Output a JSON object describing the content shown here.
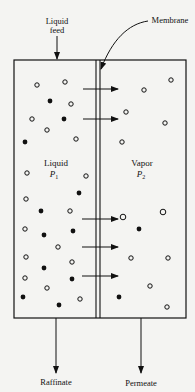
{
  "diagram": {
    "labels": {
      "feed_line1": "Liquid",
      "feed_line2": "feed",
      "membrane": "Membrane",
      "liquid": "Liquid",
      "liquid_p": "P",
      "liquid_sub": "1",
      "vapor": "Vapor",
      "vapor_p": "P",
      "vapor_sub": "2",
      "raffinate": "Raffinate",
      "permeate": "Permeate"
    },
    "colors": {
      "stroke": "#111111",
      "background": "#f4f4f2"
    },
    "box": {
      "left": 14,
      "top": 60,
      "right": 186,
      "bottom": 318
    },
    "membrane_x": [
      96,
      100
    ],
    "arrows_y": [
      89,
      119,
      219,
      247,
      276
    ],
    "open_circles_liquid": [
      [
        37,
        80
      ],
      [
        65,
        78
      ],
      [
        71,
        99
      ],
      [
        32,
        114
      ],
      [
        47,
        125
      ],
      [
        76,
        134
      ],
      [
        27,
        174
      ],
      [
        86,
        176
      ],
      [
        26,
        198
      ],
      [
        70,
        211
      ],
      [
        70,
        227
      ],
      [
        25,
        244
      ],
      [
        58,
        247
      ],
      [
        26,
        259
      ],
      [
        72,
        262
      ],
      [
        25,
        282
      ],
      [
        47,
        288
      ],
      [
        80,
        299
      ]
    ],
    "filled_circles_liquid": [
      [
        50,
        101
      ],
      [
        64,
        119
      ],
      [
        25,
        142
      ],
      [
        79,
        193
      ],
      [
        41,
        211
      ],
      [
        41,
        226
      ],
      [
        44,
        235
      ],
      [
        73,
        231
      ],
      [
        44,
        268
      ],
      [
        72,
        279
      ],
      [
        23,
        297
      ],
      [
        59,
        305
      ]
    ],
    "open_circles_vapor": [
      [
        171,
        80
      ],
      [
        144,
        90
      ],
      [
        126,
        112
      ],
      [
        165,
        123
      ],
      [
        122,
        142
      ],
      [
        123,
        217
      ],
      [
        162,
        212
      ],
      [
        131,
        258
      ],
      [
        168,
        258
      ],
      [
        150,
        286
      ],
      [
        150,
        286
      ],
      [
        167,
        307
      ]
    ],
    "filled_circles_vapor": [
      [
        139,
        229
      ],
      [
        119,
        297
      ]
    ]
  }
}
